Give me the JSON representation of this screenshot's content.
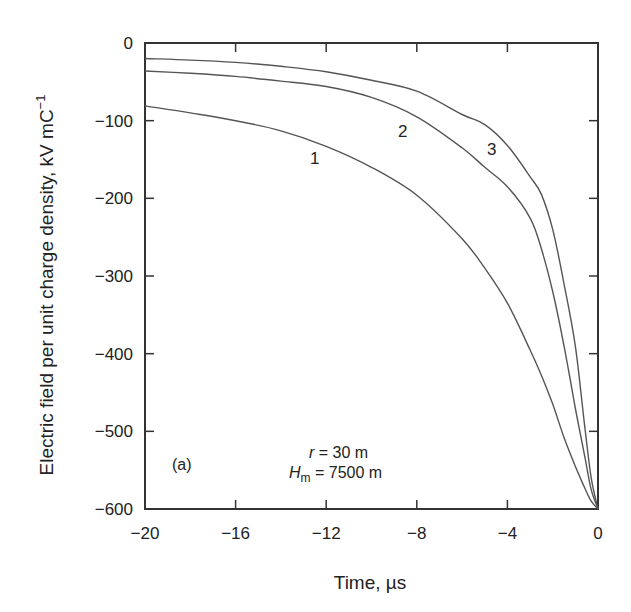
{
  "chart_data": {
    "type": "line",
    "panel_label": "(a)",
    "title": "",
    "xlabel": "Time, µs",
    "ylabel": "Electric field per unit charge density, kV mC",
    "ylabel_superscript": "−1",
    "xlim": [
      -20,
      0
    ],
    "ylim": [
      -600,
      0
    ],
    "xticks": [
      -20,
      -16,
      -12,
      -8,
      -4,
      0
    ],
    "xtick_labels": [
      "−20",
      "−16",
      "−12",
      "−8",
      "−4",
      "0"
    ],
    "yticks": [
      0,
      -100,
      -200,
      -300,
      -400,
      -500,
      -600
    ],
    "ytick_labels": [
      "0",
      "−100",
      "−200",
      "−300",
      "−400",
      "−500",
      "−600"
    ],
    "grid": false,
    "legend": "inline curve labels",
    "annotations": [
      {
        "text": "r = 30 m",
        "param": "r",
        "value": "30 m"
      },
      {
        "text": "Hm = 7500 m",
        "param": "Hm",
        "value": "7500 m"
      }
    ],
    "series": [
      {
        "name": "1",
        "x": [
          -20,
          -18,
          -16,
          -14,
          -12,
          -10,
          -8,
          -6,
          -5,
          -4,
          -3,
          -2.5,
          -2,
          -1.5,
          -1,
          -0.6,
          -0.3,
          0
        ],
        "values": [
          -81,
          -90,
          -100,
          -113,
          -133,
          -160,
          -196,
          -252,
          -290,
          -335,
          -395,
          -428,
          -465,
          -508,
          -545,
          -572,
          -590,
          -600
        ]
      },
      {
        "name": "2",
        "x": [
          -20,
          -18,
          -16,
          -14,
          -12,
          -10,
          -8,
          -6,
          -5,
          -4,
          -3,
          -2.5,
          -2,
          -1.5,
          -1,
          -0.6,
          -0.3,
          0
        ],
        "values": [
          -36,
          -39,
          -43,
          -49,
          -56,
          -70,
          -95,
          -135,
          -160,
          -185,
          -225,
          -265,
          -320,
          -390,
          -470,
          -530,
          -575,
          -600
        ]
      },
      {
        "name": "3",
        "x": [
          -20,
          -18,
          -16,
          -14,
          -12,
          -10,
          -8,
          -6,
          -5,
          -4,
          -3,
          -2.5,
          -2,
          -1.5,
          -1,
          -0.6,
          -0.3,
          0
        ],
        "values": [
          -20,
          -22,
          -25,
          -30,
          -37,
          -48,
          -62,
          -92,
          -105,
          -132,
          -172,
          -195,
          -240,
          -310,
          -390,
          -490,
          -560,
          -600
        ]
      }
    ]
  },
  "labels": {
    "panel": "(a)",
    "r_symbol": "r",
    "r_value": " = 30 m",
    "hm_symbol": "H",
    "hm_subscript": "m",
    "hm_value": " = 7500 m",
    "curve1": "1",
    "curve2": "2",
    "curve3": "3",
    "xlabel": "Time, µs",
    "ylabel_main": "Electric field per unit charge density, kV mC",
    "ylabel_sup": "−1"
  },
  "style": {
    "line_color": "#555555",
    "axis_color": "#333333",
    "text_color": "#222222"
  }
}
